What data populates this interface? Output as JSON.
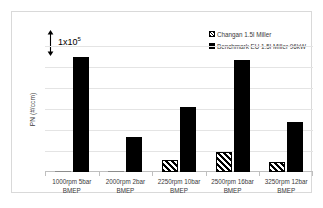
{
  "chart_data": {
    "type": "bar",
    "title": "",
    "xlabel": "",
    "ylabel": "PN (#/ccm)",
    "categories": [
      "1000rpm 5bar BMEP",
      "2000rpm 2bar BMEP",
      "2250rpm 10bar BMEP",
      "2500rpm 16bar BMEP",
      "3250rpm 12bar BMEP"
    ],
    "category_lines": [
      [
        "1000rpm 5bar",
        "BMEP"
      ],
      [
        "2000rpm 2bar",
        "BMEP"
      ],
      [
        "2250rpm 10bar",
        "BMEP"
      ],
      [
        "2500rpm 16bar",
        "BMEP"
      ],
      [
        "3250rpm 12bar",
        "BMEP"
      ]
    ],
    "series": [
      {
        "name": "Changan 1.5l Miller",
        "fill": "diagonal-hatch",
        "values": [
          2000,
          2500,
          55000,
          95000,
          50000
        ]
      },
      {
        "name": "Benchmark EU 1.5l Miller 96kW",
        "fill": "solid-black",
        "values": [
          550000,
          165000,
          310000,
          535000,
          240000
        ]
      }
    ],
    "ylim": [
      0,
      600000
    ],
    "y_tick_interval": 100000,
    "y_tick_labels_shown": false,
    "gridlines": true,
    "gridline_count": 6,
    "legend_position": "top-right",
    "annotation": {
      "label_prefix": "1x10",
      "label_exponent": "5",
      "meaning": "scale bar: one gridline interval equals 1x10^5 #/ccm"
    },
    "colors": {
      "benchmark": "#000000",
      "changan_outline": "#000000",
      "changan_fill": "#ffffff",
      "gridline": "#e4e4e4",
      "axis": "#bfbfbf",
      "text": "#3a3a3a",
      "frame": "#d9d9d9"
    }
  },
  "legend": {
    "items": [
      {
        "label": "Changan 1.5l Miller"
      },
      {
        "label": "Benchmark EU 1.5l Miller 96kW"
      }
    ]
  }
}
